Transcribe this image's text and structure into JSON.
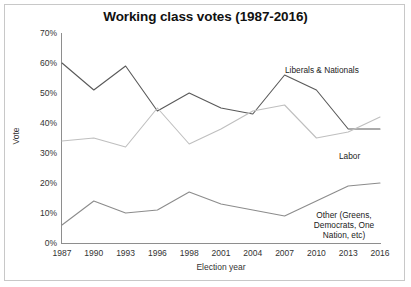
{
  "chart_data": {
    "type": "line",
    "title": "Working class votes (1987-2016)",
    "xlabel": "Election year",
    "ylabel": "Vote",
    "categories": [
      "1987",
      "1990",
      "1993",
      "1996",
      "1998",
      "2001",
      "2004",
      "2007",
      "2010",
      "2013",
      "2016"
    ],
    "x": [
      1987,
      1990,
      1993,
      1996,
      1998,
      2001,
      2004,
      2007,
      2010,
      2013,
      2016
    ],
    "ylim": [
      0,
      70
    ],
    "yticks": [
      "0%",
      "10%",
      "20%",
      "30%",
      "40%",
      "50%",
      "60%",
      "70%"
    ],
    "ytick_values": [
      0,
      10,
      20,
      30,
      40,
      50,
      60,
      70
    ],
    "grid": false,
    "legend": "inline-annotations",
    "series": [
      {
        "name": "Liberals & Nationals",
        "color": "#595959",
        "values": [
          60,
          51,
          59,
          44,
          50,
          45,
          43,
          56,
          51,
          38,
          38
        ]
      },
      {
        "name": "Labor",
        "color": "#bfbfbf",
        "values": [
          34,
          35,
          32,
          45,
          33,
          38,
          44,
          46,
          35,
          37,
          42
        ]
      },
      {
        "name": "Other (Greens, Democrats, One Nation, etc)",
        "color": "#8c8c8c",
        "values": [
          6,
          14,
          10,
          11,
          17,
          13,
          11,
          9,
          14,
          19,
          20
        ]
      }
    ],
    "annotations": [
      {
        "text": "Liberals & Nationals",
        "series": "Liberals & Nationals"
      },
      {
        "text": "Labor",
        "series": "Labor"
      },
      {
        "text": "Other (Greens, Democrats, One Nation, etc)",
        "series": "Other (Greens, Democrats, One Nation, etc)"
      }
    ]
  },
  "annotation_lines": {
    "other_line1": "Other (Greens,",
    "other_line2": "Democrats, One",
    "other_line3": "Nation, etc)"
  }
}
